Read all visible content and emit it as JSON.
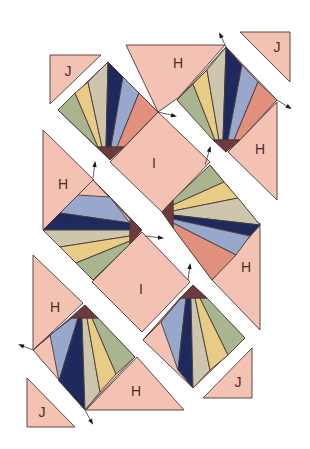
{
  "colors": {
    "background": "#f3c2b2",
    "hub": "#6e3a3e",
    "blade_green": "#a9b58f",
    "blade_yellow": "#e8cc86",
    "blade_tan": "#cdc6ac",
    "blade_navy": "#1e2a5e",
    "blade_blue": "#98a8cc",
    "blade_salmon": "#e0907c",
    "outline": "#4a3a38",
    "strip": "#ffffff"
  },
  "labels": {
    "H": "H",
    "I": "I",
    "J": "J"
  },
  "pieces": {
    "triangles": [
      {
        "name": "piece-j-top-left",
        "label": "J",
        "points": "50,55 101,55 50,104",
        "lx": 68,
        "ly": 72
      },
      {
        "name": "piece-h-top",
        "label": "H",
        "points": "126,45 225,45 178,98 158,112",
        "lx": 178,
        "ly": 64
      },
      {
        "name": "piece-j-top-right",
        "label": "J",
        "points": "240,32 290,32 290,82",
        "lx": 277,
        "ly": 48
      },
      {
        "name": "piece-h-right-upper",
        "label": "H",
        "points": "277,102 277,200 228,152",
        "lx": 260,
        "ly": 150
      },
      {
        "name": "piece-h-left",
        "label": "H",
        "points": "43,130 43,230 94,180",
        "lx": 63,
        "ly": 185
      },
      {
        "name": "piece-h-right-lower",
        "label": "H",
        "points": "260,223 260,330 212,280",
        "lx": 246,
        "ly": 268
      },
      {
        "name": "piece-h-bottom-left",
        "label": "H",
        "points": "33,255 33,350 83,303",
        "lx": 55,
        "ly": 308
      },
      {
        "name": "piece-h-bottom",
        "label": "H",
        "points": "86,410 184,410 137,357",
        "lx": 136,
        "ly": 392
      },
      {
        "name": "piece-j-bottom-right",
        "label": "J",
        "points": "203,398 252,398 252,348",
        "lx": 238,
        "ly": 383
      },
      {
        "name": "piece-j-bottom-left",
        "label": "J",
        "points": "27,378 27,427 75,427",
        "lx": 42,
        "ly": 413
      }
    ],
    "squares": [
      {
        "name": "piece-i-upper",
        "label": "I",
        "points": "158,112 210,162 162,212 110,162",
        "lx": 154,
        "ly": 164
      },
      {
        "name": "piece-i-lower",
        "label": "I",
        "points": "142,232 190,282 142,332 92,282",
        "lx": 141,
        "ly": 290
      }
    ]
  },
  "fans": [
    {
      "name": "fan-top-left",
      "outline": "108,62 158,112 110,160 58,110",
      "hub": "97,147 124,147 110,160",
      "blades": [
        {
          "color": "blade_green",
          "points": "58,110 75,93 98,147 97,147"
        },
        {
          "color": "blade_yellow",
          "points": "75,93 88,82 102,147 98,147"
        },
        {
          "color": "blade_tan",
          "points": "88,82 108,62 106,147 102,147"
        },
        {
          "color": "blade_navy",
          "points": "108,62 123,77 111,147 106,147"
        },
        {
          "color": "blade_blue",
          "points": "123,77 139,93 117,147 111,147"
        },
        {
          "color": "blade_salmon",
          "points": "139,93 158,112 124,147 117,147"
        }
      ]
    },
    {
      "name": "fan-top-right",
      "outline": "226,47 277,100 226,152 177,100",
      "hub": "213,140 240,140 226,152",
      "blades": [
        {
          "color": "blade_green",
          "points": "177,100 193,84 215,140 213,140"
        },
        {
          "color": "blade_yellow",
          "points": "193,84 207,70 219,140 215,140"
        },
        {
          "color": "blade_tan",
          "points": "207,70 226,47 223,140 219,140"
        },
        {
          "color": "blade_navy",
          "points": "226,47 242,65 228,140 223,140"
        },
        {
          "color": "blade_blue",
          "points": "242,65 258,82 234,140 228,140"
        },
        {
          "color": "blade_salmon",
          "points": "258,82 277,100 240,140 234,140"
        }
      ]
    },
    {
      "name": "fan-middle-left",
      "outline": "93,180 142,230 93,280 43,230",
      "hub": "130,218 142,230 130,244",
      "blades": [
        {
          "color": "blade_salmon",
          "points": "93,180 110,197 130,218 130,219"
        },
        {
          "color": "blade_blue",
          "points": "110,197 78,195 60,213 130,223"
        },
        {
          "color": "blade_navy",
          "points": "60,213 43,230 130,230 130,223"
        },
        {
          "color": "blade_tan",
          "points": "43,230 60,247 130,236 130,230"
        },
        {
          "color": "blade_yellow",
          "points": "60,247 76,263 130,241 130,236"
        },
        {
          "color": "blade_green",
          "points": "76,263 93,280 130,244 130,241"
        }
      ]
    },
    {
      "name": "fan-middle-right",
      "outline": "210,165 260,225 212,280 162,212",
      "hub": "173,200 162,212 173,228",
      "blades": [
        {
          "color": "blade_green",
          "points": "210,165 224,182 173,205 173,200"
        },
        {
          "color": "blade_yellow",
          "points": "224,182 238,198 173,211 173,205"
        },
        {
          "color": "blade_tan",
          "points": "238,198 260,225 173,215 173,211"
        },
        {
          "color": "blade_navy",
          "points": "260,225 250,236 173,219 173,215"
        },
        {
          "color": "blade_blue",
          "points": "250,236 236,255 173,223 173,219"
        },
        {
          "color": "blade_salmon",
          "points": "236,255 212,280 173,228 173,223"
        }
      ]
    },
    {
      "name": "fan-bottom-left",
      "outline": "85,305 135,357 85,410 33,350",
      "hub": "71,318 98,318 85,305",
      "blades": [
        {
          "color": "blade_salmon",
          "points": "33,350 50,335 72,318 71,318"
        },
        {
          "color": "blade_blue",
          "points": "50,335 59,381 78,318 72,318"
        },
        {
          "color": "blade_navy",
          "points": "59,381 85,410 82,318 78,318"
        },
        {
          "color": "blade_tan",
          "points": "85,410 100,392 87,318 82,318"
        },
        {
          "color": "blade_yellow",
          "points": "100,392 116,374 92,318 87,318"
        },
        {
          "color": "blade_green",
          "points": "116,374 135,357 98,318 92,318"
        }
      ]
    },
    {
      "name": "fan-bottom-right",
      "outline": "193,285 245,338 193,388 143,340",
      "hub": "180,298 207,298 193,285",
      "blades": [
        {
          "color": "blade_salmon",
          "points": "143,340 161,322 181,298 180,298"
        },
        {
          "color": "blade_blue",
          "points": "161,322 178,370 186,298 181,298"
        },
        {
          "color": "blade_navy",
          "points": "178,370 193,388 191,298 186,298"
        },
        {
          "color": "blade_tan",
          "points": "193,388 210,370 195,298 191,298"
        },
        {
          "color": "blade_yellow",
          "points": "210,370 228,355 200,298 195,298"
        },
        {
          "color": "blade_green",
          "points": "228,355 245,338 207,298 200,298"
        }
      ]
    }
  ],
  "arrows": [
    {
      "name": "seam-arrow-top-right-up",
      "x1": 226,
      "y1": 47,
      "x2": 220,
      "y2": 34
    },
    {
      "name": "seam-arrow-top-right-down",
      "x1": 277,
      "y1": 100,
      "x2": 290,
      "y2": 108
    },
    {
      "name": "seam-arrow-top-left-fan",
      "x1": 158,
      "y1": 112,
      "x2": 175,
      "y2": 116
    },
    {
      "name": "seam-arrow-upper-middle",
      "x1": 205,
      "y1": 165,
      "x2": 210,
      "y2": 148
    },
    {
      "name": "seam-arrow-left-h",
      "x1": 93,
      "y1": 178,
      "x2": 95,
      "y2": 163
    },
    {
      "name": "seam-arrow-middle-left-hub",
      "x1": 145,
      "y1": 236,
      "x2": 162,
      "y2": 238
    },
    {
      "name": "seam-arrow-lower-middle",
      "x1": 188,
      "y1": 280,
      "x2": 190,
      "y2": 265
    },
    {
      "name": "seam-arrow-bottom-left-up",
      "x1": 33,
      "y1": 350,
      "x2": 20,
      "y2": 345
    },
    {
      "name": "seam-arrow-bottom-left-down",
      "x1": 85,
      "y1": 410,
      "x2": 92,
      "y2": 423
    }
  ]
}
